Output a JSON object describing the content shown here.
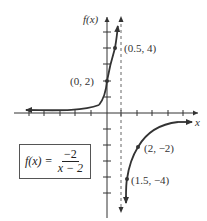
{
  "figure": {
    "y_axis_label": "f(x)",
    "x_axis_label": "x",
    "function_box": {
      "lhs": "f(x) =",
      "numerator": "−2",
      "denominator": "x − 2"
    },
    "points": [
      {
        "label": "(0.5, 4)"
      },
      {
        "label": "(0, 2)"
      },
      {
        "label": "(2, −2)"
      },
      {
        "label": "(1.5, −4)"
      }
    ],
    "asymptote": "vertical dashed line",
    "colors": {
      "curve": "#333333",
      "axis": "#333333",
      "asymptote": "#555555"
    }
  }
}
